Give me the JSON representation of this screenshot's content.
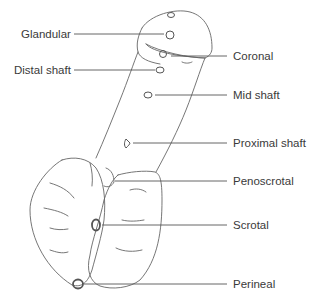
{
  "diagram": {
    "type": "anatomical line drawing",
    "line_color": "#555555",
    "text_color": "#3a3a3a",
    "labels": {
      "glandular": "Glandular",
      "coronal": "Coronal",
      "distal_shaft": "Distal shaft",
      "mid_shaft": "Mid shaft",
      "proximal_shaft": "Proximal shaft",
      "penoscrotal": "Penoscrotal",
      "scrotal": "Scrotal",
      "perineal": "Perineal"
    }
  }
}
